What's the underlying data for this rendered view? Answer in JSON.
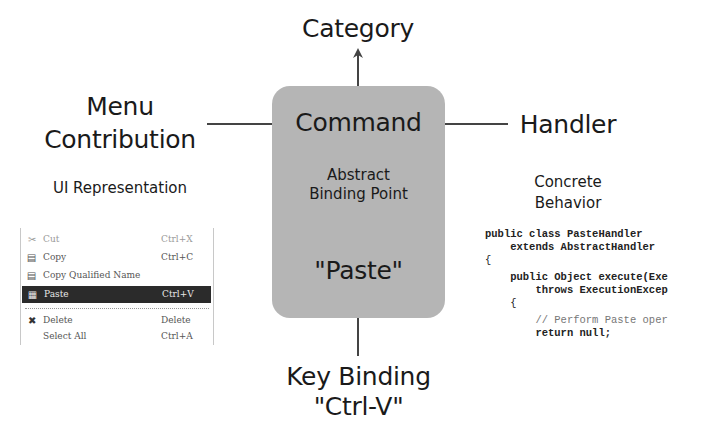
{
  "diagram": {
    "center": {
      "title": "Command",
      "subtitle_line1": "Abstract",
      "subtitle_line2": "Binding Point",
      "example": "\"Paste\"",
      "fill_color": "#b5b5b5"
    },
    "top": {
      "label": "Category"
    },
    "left": {
      "label_line1": "Menu",
      "label_line2": "Contribution",
      "caption": "UI Representation"
    },
    "right": {
      "label": "Handler",
      "caption_line1": "Concrete",
      "caption_line2": "Behavior"
    },
    "bottom": {
      "label_line1": "Key Binding",
      "label_line2": "\"Ctrl-V\""
    },
    "arrow_color": "#444444"
  },
  "menu": {
    "items": [
      {
        "icon": "scissors-icon",
        "glyph": "✂",
        "label": "Cut",
        "shortcut": "Ctrl+X",
        "state": "disabled"
      },
      {
        "icon": "copy-icon",
        "glyph": "▤",
        "label": "Copy",
        "shortcut": "Ctrl+C",
        "state": "normal"
      },
      {
        "icon": "copy-qualified-icon",
        "glyph": "▤",
        "label": "Copy Qualified Name",
        "shortcut": "",
        "state": "normal"
      },
      {
        "icon": "paste-icon",
        "glyph": "▦",
        "label": "Paste",
        "shortcut": "Ctrl+V",
        "state": "selected"
      },
      {
        "icon": "delete-icon",
        "glyph": "✖",
        "label": "Delete",
        "shortcut": "Delete",
        "state": "normal"
      },
      {
        "icon": "",
        "glyph": "",
        "label": "Select All",
        "shortcut": "Ctrl+A",
        "state": "normal"
      }
    ]
  },
  "code": {
    "lines": [
      "public class PasteHandler",
      "    extends AbstractHandler",
      "{",
      "    public Object execute(Exe",
      "        throws ExecutionExcep",
      "    {",
      "        // Perform Paste oper",
      "        return null;"
    ]
  }
}
